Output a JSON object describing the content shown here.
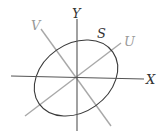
{
  "diagram": {
    "labels": {
      "x_axis": "X",
      "y_axis": "Y",
      "u_axis": "U",
      "v_axis": "V",
      "ellipse": "S"
    },
    "colors": {
      "primary_axes": "#333333",
      "rotated_axes": "#a0a0a0",
      "ellipse": "#333333",
      "label_dark": "#333333",
      "label_light": "#999999"
    }
  }
}
